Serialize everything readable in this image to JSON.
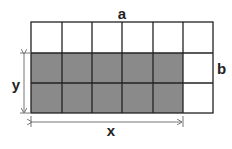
{
  "diagram": {
    "labels": {
      "top": "a",
      "right": "b",
      "left": "y",
      "bottom": "x"
    },
    "grid": {
      "columns": 6,
      "rows": 3,
      "shaded_columns": 5,
      "shaded_rows": 2,
      "shaded_position": "bottom-left"
    },
    "colors": {
      "shade": "#888888",
      "line": "#222222",
      "arrow": "#777777",
      "background": "#ffffff"
    }
  }
}
